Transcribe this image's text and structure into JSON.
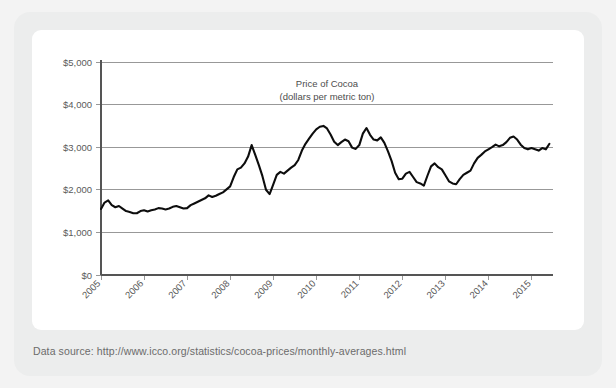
{
  "caption": "Data source: http://www.icco.org/statistics/cocoa-prices/monthly-averages.html",
  "colors": {
    "page_background": "#f3f3f3",
    "outer_card": "#eceded",
    "chart_card": "#ffffff",
    "line": "#0d0d0d",
    "gridline": "#8d8d8d",
    "axis": "#555555",
    "label_text": "#5a5a5a",
    "caption_text": "#6b6b6b"
  },
  "chart_data": {
    "type": "line",
    "title": "Price of Cocoa",
    "subtitle": "(dollars per metric ton)",
    "xlabel": "",
    "ylabel": "",
    "ylim": [
      0,
      5000
    ],
    "xlim": [
      2005,
      2015.5
    ],
    "grid": true,
    "legend": "none",
    "ytick_labels": [
      "$0",
      "$1,000",
      "$2,000",
      "$3,000",
      "$4,000",
      "$5,000"
    ],
    "ytick_values": [
      0,
      1000,
      2000,
      3000,
      4000,
      5000
    ],
    "xtick_labels": [
      "2005",
      "2006",
      "2007",
      "2008",
      "2009",
      "2010",
      "2011",
      "2012",
      "2013",
      "2014",
      "2015"
    ],
    "xtick_values": [
      2005,
      2006,
      2007,
      2008,
      2009,
      2010,
      2011,
      2012,
      2013,
      2014,
      2015
    ],
    "series": [
      {
        "name": "Price of Cocoa",
        "x": [
          2005.0,
          2005.083,
          2005.167,
          2005.25,
          2005.333,
          2005.417,
          2005.5,
          2005.583,
          2005.667,
          2005.75,
          2005.833,
          2005.917,
          2006.0,
          2006.083,
          2006.167,
          2006.25,
          2006.333,
          2006.417,
          2006.5,
          2006.583,
          2006.667,
          2006.75,
          2006.833,
          2006.917,
          2007.0,
          2007.083,
          2007.167,
          2007.25,
          2007.333,
          2007.417,
          2007.5,
          2007.583,
          2007.667,
          2007.75,
          2007.833,
          2007.917,
          2008.0,
          2008.083,
          2008.167,
          2008.25,
          2008.333,
          2008.417,
          2008.5,
          2008.583,
          2008.667,
          2008.75,
          2008.833,
          2008.917,
          2009.0,
          2009.083,
          2009.167,
          2009.25,
          2009.333,
          2009.417,
          2009.5,
          2009.583,
          2009.667,
          2009.75,
          2009.833,
          2009.917,
          2010.0,
          2010.083,
          2010.167,
          2010.25,
          2010.333,
          2010.417,
          2010.5,
          2010.583,
          2010.667,
          2010.75,
          2010.833,
          2010.917,
          2011.0,
          2011.083,
          2011.167,
          2011.25,
          2011.333,
          2011.417,
          2011.5,
          2011.583,
          2011.667,
          2011.75,
          2011.833,
          2011.917,
          2012.0,
          2012.083,
          2012.167,
          2012.25,
          2012.333,
          2012.417,
          2012.5,
          2012.583,
          2012.667,
          2012.75,
          2012.833,
          2012.917,
          2013.0,
          2013.083,
          2013.167,
          2013.25,
          2013.333,
          2013.417,
          2013.5,
          2013.583,
          2013.667,
          2013.75,
          2013.833,
          2013.917,
          2014.0,
          2014.083,
          2014.167,
          2014.25,
          2014.333,
          2014.417,
          2014.5,
          2014.583,
          2014.667,
          2014.75,
          2014.833,
          2014.917,
          2015.0,
          2015.083,
          2015.167,
          2015.25,
          2015.333,
          2015.417
        ],
        "values": [
          1550,
          1700,
          1750,
          1640,
          1590,
          1620,
          1560,
          1500,
          1480,
          1450,
          1450,
          1500,
          1520,
          1490,
          1520,
          1540,
          1570,
          1560,
          1540,
          1560,
          1600,
          1620,
          1590,
          1560,
          1570,
          1640,
          1680,
          1720,
          1760,
          1800,
          1870,
          1830,
          1860,
          1900,
          1940,
          2010,
          2080,
          2300,
          2480,
          2520,
          2620,
          2780,
          3050,
          2820,
          2580,
          2320,
          2000,
          1900,
          2120,
          2350,
          2420,
          2380,
          2450,
          2520,
          2580,
          2700,
          2920,
          3080,
          3200,
          3320,
          3420,
          3480,
          3500,
          3440,
          3300,
          3130,
          3050,
          3120,
          3180,
          3140,
          2990,
          2960,
          3050,
          3320,
          3450,
          3290,
          3180,
          3160,
          3230,
          3100,
          2900,
          2680,
          2400,
          2250,
          2260,
          2380,
          2420,
          2300,
          2180,
          2150,
          2100,
          2330,
          2550,
          2620,
          2530,
          2480,
          2340,
          2200,
          2150,
          2130,
          2250,
          2350,
          2400,
          2450,
          2620,
          2750,
          2820,
          2900,
          2950,
          3000,
          3060,
          3020,
          3050,
          3120,
          3220,
          3250,
          3180,
          3060,
          2980,
          2950,
          2980,
          2950,
          2920,
          2980,
          2950,
          3080
        ]
      }
    ]
  }
}
